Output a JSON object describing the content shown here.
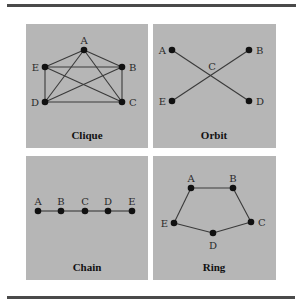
{
  "colors": {
    "panel_bg": "#b6b6b6",
    "rule": "#4a4a4a",
    "edge": "#3a3a3a",
    "node": "#111111"
  },
  "panels": [
    {
      "title": "Clique",
      "nodes": [
        {
          "id": "A",
          "x": 84,
          "y": 50,
          "lx": 84,
          "ly": 44,
          "anchor": "middle"
        },
        {
          "id": "B",
          "x": 122,
          "y": 67,
          "lx": 129,
          "ly": 71,
          "anchor": "start"
        },
        {
          "id": "C",
          "x": 122,
          "y": 102,
          "lx": 129,
          "ly": 106,
          "anchor": "start"
        },
        {
          "id": "D",
          "x": 45,
          "y": 102,
          "lx": 39,
          "ly": 106,
          "anchor": "end"
        },
        {
          "id": "E",
          "x": 45,
          "y": 67,
          "lx": 39,
          "ly": 71,
          "anchor": "end"
        }
      ],
      "edges": [
        [
          "A",
          "B"
        ],
        [
          "A",
          "C"
        ],
        [
          "A",
          "D"
        ],
        [
          "A",
          "E"
        ],
        [
          "B",
          "C"
        ],
        [
          "B",
          "D"
        ],
        [
          "B",
          "E"
        ],
        [
          "C",
          "D"
        ],
        [
          "C",
          "E"
        ],
        [
          "D",
          "E"
        ]
      ]
    },
    {
      "title": "Orbit",
      "nodes": [
        {
          "id": "A",
          "x": 172,
          "y": 50,
          "lx": 166,
          "ly": 54,
          "anchor": "end"
        },
        {
          "id": "B",
          "x": 249,
          "y": 50,
          "lx": 256,
          "ly": 54,
          "anchor": "start"
        },
        {
          "id": "D",
          "x": 249,
          "y": 101,
          "lx": 256,
          "ly": 105,
          "anchor": "start"
        },
        {
          "id": "E",
          "x": 172,
          "y": 101,
          "lx": 166,
          "ly": 105,
          "anchor": "end"
        }
      ],
      "center_label": {
        "id": "C",
        "x": 212,
        "y": 70
      },
      "edges": [
        [
          "A",
          "D"
        ],
        [
          "B",
          "E"
        ]
      ]
    },
    {
      "title": "Chain",
      "nodes": [
        {
          "id": "A",
          "x": 38,
          "y": 211,
          "lx": 38,
          "ly": 205,
          "anchor": "middle"
        },
        {
          "id": "B",
          "x": 61,
          "y": 211,
          "lx": 61,
          "ly": 205,
          "anchor": "middle"
        },
        {
          "id": "C",
          "x": 85,
          "y": 211,
          "lx": 85,
          "ly": 205,
          "anchor": "middle"
        },
        {
          "id": "D",
          "x": 108,
          "y": 211,
          "lx": 108,
          "ly": 205,
          "anchor": "middle"
        },
        {
          "id": "E",
          "x": 132,
          "y": 211,
          "lx": 132,
          "ly": 205,
          "anchor": "middle"
        }
      ],
      "edges": [
        [
          "A",
          "B"
        ],
        [
          "B",
          "C"
        ],
        [
          "C",
          "D"
        ],
        [
          "D",
          "E"
        ]
      ]
    },
    {
      "title": "Ring",
      "nodes": [
        {
          "id": "A",
          "x": 191,
          "y": 188,
          "lx": 191,
          "ly": 182,
          "anchor": "middle"
        },
        {
          "id": "B",
          "x": 233,
          "y": 188,
          "lx": 233,
          "ly": 182,
          "anchor": "middle"
        },
        {
          "id": "C",
          "x": 251,
          "y": 222,
          "lx": 258,
          "ly": 226,
          "anchor": "start"
        },
        {
          "id": "D",
          "x": 213,
          "y": 233,
          "lx": 213,
          "ly": 249,
          "anchor": "middle"
        },
        {
          "id": "E",
          "x": 174,
          "y": 223,
          "lx": 168,
          "ly": 227,
          "anchor": "end"
        }
      ],
      "edges": [
        [
          "A",
          "B"
        ],
        [
          "B",
          "C"
        ],
        [
          "C",
          "D"
        ],
        [
          "D",
          "E"
        ],
        [
          "E",
          "A"
        ]
      ]
    }
  ]
}
